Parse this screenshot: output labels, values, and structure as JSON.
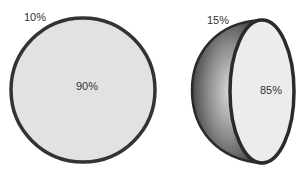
{
  "diagrams": [
    {
      "name": "flat-circle",
      "outer_label": "10%",
      "inner_label": "90%",
      "fill": "#e2e2e2",
      "stroke": "#333333"
    },
    {
      "name": "hemisphere",
      "outer_label": "15%",
      "inner_label": "85%",
      "face_fill": "#ececec",
      "shell_dark": "#444444",
      "shell_light": "#d8d8d8",
      "stroke": "#2a2a2a"
    }
  ]
}
